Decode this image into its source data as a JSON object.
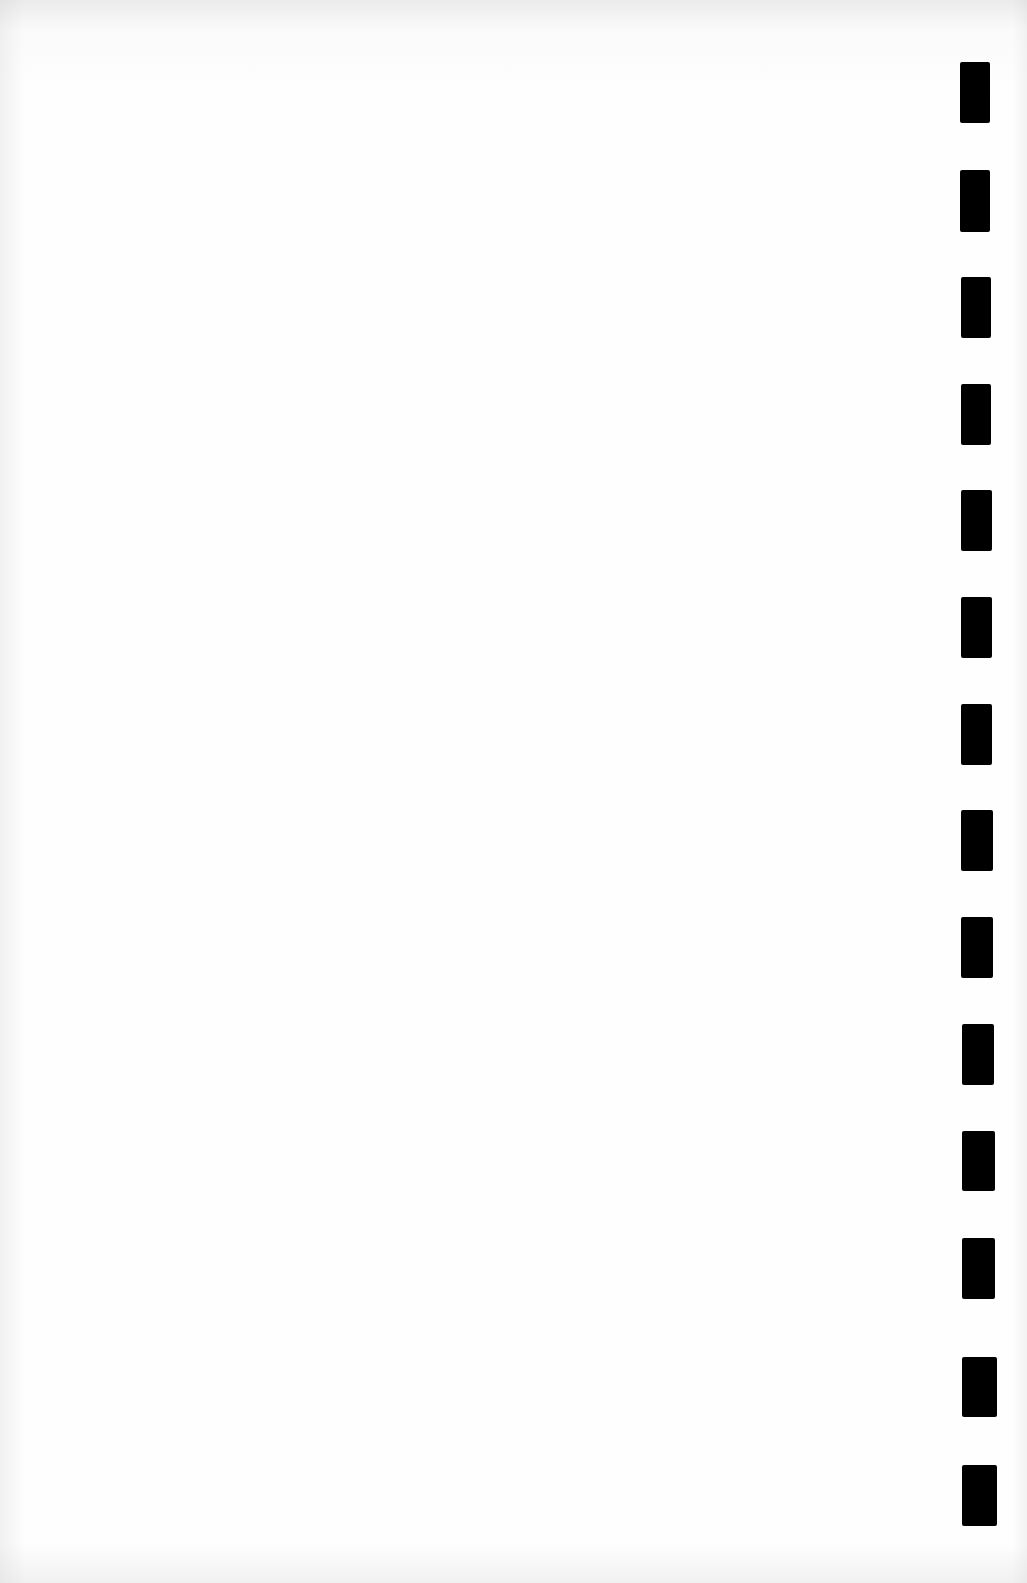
{
  "page": {
    "type": "blank scanned page",
    "text": "",
    "background_color": "#fdfdfd"
  },
  "timing_marks": {
    "count": 14,
    "color": "#000000",
    "marks": [
      {
        "x": 960,
        "y": 62,
        "w": 30,
        "h": 61
      },
      {
        "x": 960,
        "y": 170,
        "w": 30,
        "h": 62
      },
      {
        "x": 961,
        "y": 277,
        "w": 30,
        "h": 61
      },
      {
        "x": 961,
        "y": 384,
        "w": 30,
        "h": 61
      },
      {
        "x": 961,
        "y": 490,
        "w": 31,
        "h": 61
      },
      {
        "x": 961,
        "y": 597,
        "w": 31,
        "h": 61
      },
      {
        "x": 961,
        "y": 704,
        "w": 31,
        "h": 61
      },
      {
        "x": 961,
        "y": 810,
        "w": 32,
        "h": 61
      },
      {
        "x": 961,
        "y": 917,
        "w": 32,
        "h": 61
      },
      {
        "x": 962,
        "y": 1024,
        "w": 32,
        "h": 61
      },
      {
        "x": 962,
        "y": 1131,
        "w": 33,
        "h": 60
      },
      {
        "x": 962,
        "y": 1238,
        "w": 33,
        "h": 61
      },
      {
        "x": 962,
        "y": 1357,
        "w": 35,
        "h": 60
      },
      {
        "x": 962,
        "y": 1465,
        "w": 35,
        "h": 61
      }
    ]
  }
}
